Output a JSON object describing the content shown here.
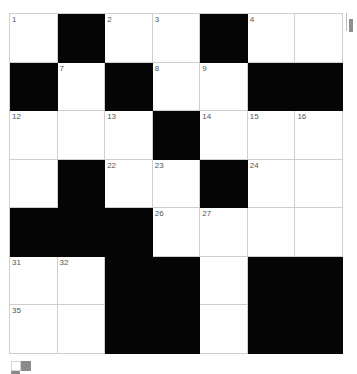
{
  "puzzle": {
    "rows": 7,
    "cols": 7,
    "grid": [
      [
        {
          "n": "1"
        },
        {
          "b": true
        },
        {
          "n": "2"
        },
        {
          "n": "3"
        },
        {
          "b": true
        },
        {
          "n": "4"
        },
        {
          "n": ""
        }
      ],
      [
        {
          "b": true
        },
        {
          "n": "7"
        },
        {
          "b": true
        },
        {
          "n": "8"
        },
        {
          "n": "9"
        },
        {
          "b": true
        },
        {
          "b": true
        }
      ],
      [
        {
          "n": "12"
        },
        {
          "n": ""
        },
        {
          "n": "13"
        },
        {
          "b": true
        },
        {
          "n": "14"
        },
        {
          "n": "15"
        },
        {
          "n": "16"
        }
      ],
      [
        {
          "n": ""
        },
        {
          "b": true
        },
        {
          "n": "22"
        },
        {
          "n": "23"
        },
        {
          "b": true
        },
        {
          "n": "24"
        },
        {
          "n": ""
        }
      ],
      [
        {
          "b": true
        },
        {
          "b": true
        },
        {
          "b": true
        },
        {
          "n": "26"
        },
        {
          "n": "27"
        },
        {
          "n": ""
        },
        {
          "n": ""
        }
      ],
      [
        {
          "n": "31"
        },
        {
          "n": "32"
        },
        {
          "b": true
        },
        {
          "b": true
        },
        {
          "n": ""
        },
        {
          "b": true
        },
        {
          "b": true
        }
      ],
      [
        {
          "n": "35"
        },
        {
          "n": ""
        },
        {
          "b": true
        },
        {
          "b": true
        },
        {
          "n": ""
        },
        {
          "b": true
        },
        {
          "b": true
        }
      ]
    ]
  },
  "colors": {
    "black_cell": "#050505",
    "grid_line": "#cfcfcf",
    "number_text": "#555555"
  },
  "icons": {
    "scroll_indicator": "scrollbar-thumb-icon",
    "bottom_icon": "grid-toggle-icon"
  }
}
